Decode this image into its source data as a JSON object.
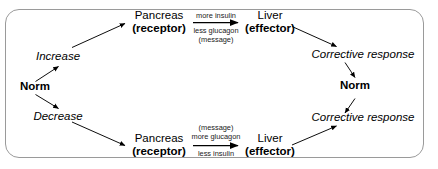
{
  "diagram": {
    "frame": {
      "border_color": "#9a9a9a"
    },
    "nodes": {
      "norm_left": "Norm",
      "norm_right": "Norm",
      "increase": "Increase",
      "decrease": "Decrease",
      "pancreas_top_organ": "Pancreas",
      "pancreas_top_role": "(receptor)",
      "pancreas_bottom_organ": "Pancreas",
      "pancreas_bottom_role": "(receptor)",
      "liver_top_organ": "Liver",
      "liver_top_role": "(effector)",
      "liver_bottom_organ": "Liver",
      "liver_bottom_role": "(effector)",
      "corrective_top": "Corrective response",
      "corrective_bottom": "Corrective response"
    },
    "messages": {
      "top_above": "more insulin",
      "top_below_1": "less glucagon",
      "top_below_2": "(message)",
      "bottom_above_1": "(message)",
      "bottom_above_2": "more glucagon",
      "bottom_below": "less insulin"
    }
  }
}
